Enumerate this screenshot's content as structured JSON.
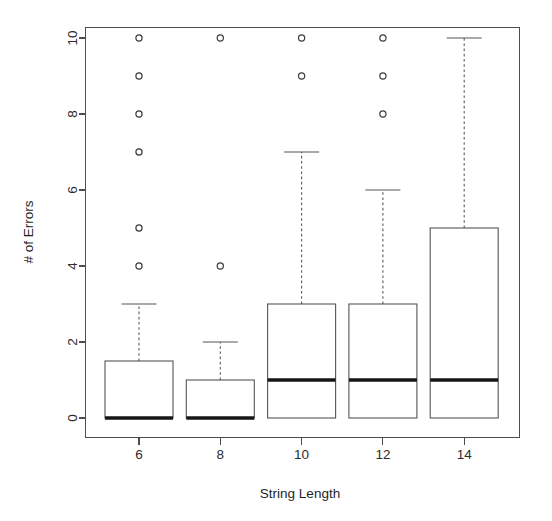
{
  "figure": {
    "background_color": "#ffffff",
    "line_color": "#4d4d4d",
    "median_color": "#161616"
  },
  "chart_data": {
    "type": "box",
    "title": "",
    "xlabel": "String Length",
    "ylabel": "# of Errors",
    "categories": [
      "6",
      "8",
      "10",
      "12",
      "14"
    ],
    "x_tick_labels": [
      "6",
      "8",
      "10",
      "12",
      "14"
    ],
    "y_tick_labels": [
      "0",
      "2",
      "4",
      "6",
      "8",
      "10"
    ],
    "y_ticks": [
      0,
      2,
      4,
      6,
      8,
      10
    ],
    "ylim": [
      -0.5,
      10.8
    ],
    "grid": false,
    "legend": "none",
    "boxes": [
      {
        "category": "6",
        "x": 6,
        "whisker_low": 0,
        "q1": 0,
        "median": 0,
        "q3": 1.5,
        "whisker_high": 3,
        "outliers": [
          4,
          5,
          7,
          8,
          9,
          10
        ]
      },
      {
        "category": "8",
        "x": 8,
        "whisker_low": 0,
        "q1": 0,
        "median": 0,
        "q3": 1,
        "whisker_high": 2,
        "outliers": [
          4,
          10
        ]
      },
      {
        "category": "10",
        "x": 10,
        "whisker_low": 0,
        "q1": 0,
        "median": 1,
        "q3": 3,
        "whisker_high": 7,
        "outliers": [
          9,
          10
        ]
      },
      {
        "category": "12",
        "x": 12,
        "whisker_low": 0,
        "q1": 0,
        "median": 1,
        "q3": 3,
        "whisker_high": 6,
        "outliers": [
          8,
          9,
          10
        ]
      },
      {
        "category": "14",
        "x": 14,
        "whisker_low": 0,
        "q1": 0,
        "median": 1,
        "q3": 5,
        "whisker_high": 10,
        "outliers": []
      }
    ]
  }
}
